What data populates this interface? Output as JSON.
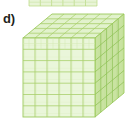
{
  "figure": {
    "label": "d)",
    "kind": "base-ten-block-thousand-cube",
    "canvas": {
      "width": 129,
      "height": 121,
      "background": "#ffffff"
    },
    "colors": {
      "front_face_fill": "#eaf6da",
      "top_face_fill": "#e2f2cd",
      "right_face_fill": "#c9e3a1",
      "grid_line": "#a8cf6b",
      "grid_line_light": "#cbe6a4",
      "outline": "#9cc95c",
      "label_color": "#231f20"
    },
    "grid": {
      "front_columns": 6,
      "front_rows": 7,
      "top_depth": 5,
      "side_depth": 5
    },
    "geometry": {
      "front": {
        "left": 23,
        "top": 38,
        "right": 95,
        "bottom": 117
      },
      "top": {
        "fl": [
          23,
          38
        ],
        "fr": [
          95,
          38
        ],
        "br": [
          124,
          14
        ],
        "bl": [
          52,
          14
        ]
      },
      "right": {
        "fl": [
          95,
          38
        ],
        "fr": [
          124,
          14
        ],
        "br": [
          124,
          93
        ],
        "bl": [
          95,
          117
        ]
      }
    }
  },
  "cutoff_figure": {
    "label": "",
    "description": "Bottom sliver of the figure above, a row of unit blocks cropped by the top edge",
    "segments": 6,
    "bounds": {
      "left": 29,
      "top": 0,
      "right": 97,
      "bottom": 6
    },
    "colors": {
      "fill": "#e8f4d6",
      "line": "#b8d97f"
    }
  }
}
